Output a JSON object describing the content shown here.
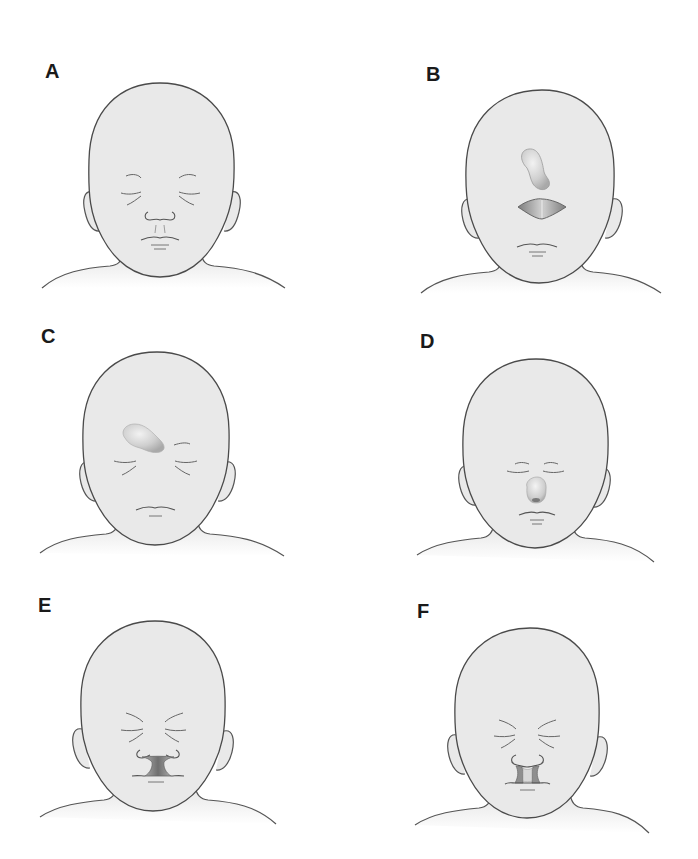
{
  "figure": {
    "colors": {
      "background": "#ffffff",
      "skin_fill": "#e9e9e9",
      "outline": "#4a4a4a",
      "feature_line": "#6e6e6e",
      "lesion_shade": "#9a9a9a",
      "cleft_dark": "#777777"
    },
    "panels": [
      {
        "label": "A",
        "variant": "normal-face",
        "description": "Normal infant face with closed eyes, nose and mouth"
      },
      {
        "label": "B",
        "variant": "proboscis-above-single-cleft",
        "description": "Proboscis on forehead above a central diamond-shaped opening, no nose"
      },
      {
        "label": "C",
        "variant": "proboscis-between-eyes",
        "description": "Proboscis arising at the glabella between the eyes, no nose"
      },
      {
        "label": "D",
        "variant": "single-nostril-nose",
        "description": "Small rounded nose with a single nostril, close-set eyes"
      },
      {
        "label": "E",
        "variant": "median-cleft-lip",
        "description": "Flat nose with a broad median cleft of the upper lip"
      },
      {
        "label": "F",
        "variant": "bilateral-cleft-lip",
        "description": "Nose with bilateral clefts of the upper lip and central premaxillary segment"
      }
    ]
  }
}
